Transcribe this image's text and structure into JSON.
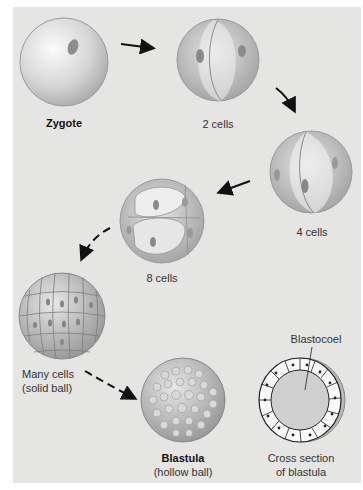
{
  "figure": {
    "stages": [
      {
        "id": "zygote",
        "label": "Zygote",
        "bold": true
      },
      {
        "id": "two-cells",
        "label": "2 cells"
      },
      {
        "id": "four-cells",
        "label": "4 cells"
      },
      {
        "id": "eight-cells",
        "label": "8 cells"
      },
      {
        "id": "morula",
        "label_line1": "Many cells",
        "label_line2": "(solid ball)"
      },
      {
        "id": "blastula",
        "label_line1": "Blastula",
        "label_line2": "(hollow ball)",
        "bold_line1": true
      },
      {
        "id": "blastula-cross-section",
        "label_line1": "Cross section",
        "label_line2": "of blastula"
      }
    ],
    "annotations": {
      "blastocoel": "Blastocoel"
    },
    "colors": {
      "panel_bg": "#e5e5e4",
      "cell_fill": "#dcdcdc",
      "cell_shadow": "#a8a8a8",
      "arrow": "#111111"
    }
  }
}
